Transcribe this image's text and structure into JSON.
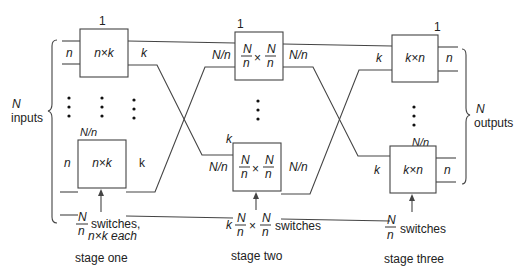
{
  "diagram": {
    "inputs": {
      "n_label": "N",
      "word": "inputs"
    },
    "outputs": {
      "n_label": "N",
      "word": "outputs"
    },
    "stage_one": {
      "label": "stage one",
      "top_index": "1",
      "bottom_index": "N/n",
      "box_label": "n×k",
      "in_label": "n",
      "out_label_top": "k",
      "out_label_bottom": "k",
      "count_num": "N",
      "count_den": "n",
      "count_text": "switches,",
      "count_text2": "n×k each"
    },
    "stage_two": {
      "label": "stage two",
      "top_index": "1",
      "bottom_index": "k",
      "box_num": "N",
      "box_den": "n",
      "box_times": "×",
      "in_label": "N/n",
      "out_label": "N/n",
      "count_prefix": "k",
      "count_text": "switches"
    },
    "stage_three": {
      "label": "stage three",
      "top_index": "1",
      "bottom_index": "N/n",
      "box_label": "k×n",
      "in_label": "k",
      "out_label": "n",
      "count_num": "N",
      "count_den": "n",
      "count_text": "switches"
    },
    "colors": {
      "line": "#444444",
      "text": "#222222",
      "background": "#ffffff"
    }
  }
}
